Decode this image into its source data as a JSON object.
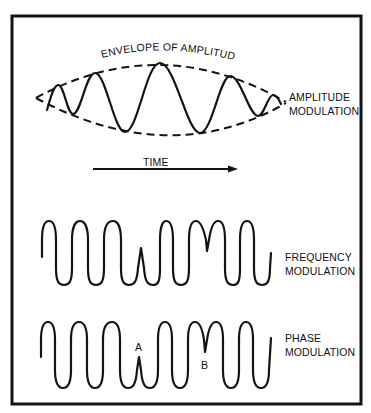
{
  "colors": {
    "ink": "#141414",
    "background": "#ffffff"
  },
  "amplitude_section": {
    "envelope_label": "ENVELOPE OF AMPLITUDE",
    "label_line1": "AMPLITUDE",
    "label_line2": "MODULATION"
  },
  "time_axis": {
    "label": "TIME"
  },
  "frequency_section": {
    "label_line1": "FREQUENCY",
    "label_line2": "MODULATION"
  },
  "phase_section": {
    "label_line1": "PHASE",
    "label_line2": "MODULATION",
    "marker_a": "A",
    "marker_b": "B"
  }
}
